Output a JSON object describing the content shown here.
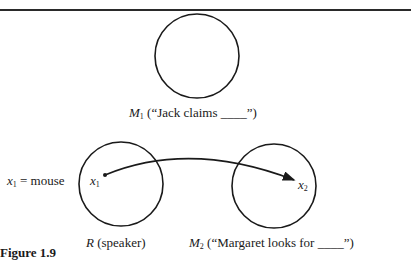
{
  "figure": {
    "caption": "Figure 1.9"
  },
  "spaces": {
    "m1": {
      "symbol": "M",
      "subscript": "1",
      "label": " (“Jack claims ____”)"
    },
    "r": {
      "symbol": "R",
      "label": " (speaker)"
    },
    "m2": {
      "symbol": "M",
      "subscript": "2",
      "label": " (“Margaret looks for ____”)"
    }
  },
  "elements": {
    "x1_definition": {
      "symbol": "x",
      "subscript": "1",
      "text": " = mouse"
    },
    "x1_in_r": {
      "symbol": "x",
      "subscript": "1"
    },
    "x2_in_m2": {
      "symbol": "x",
      "subscript": "2"
    }
  },
  "connector": {
    "from": "x1",
    "to": "x2",
    "type": "arrow"
  }
}
